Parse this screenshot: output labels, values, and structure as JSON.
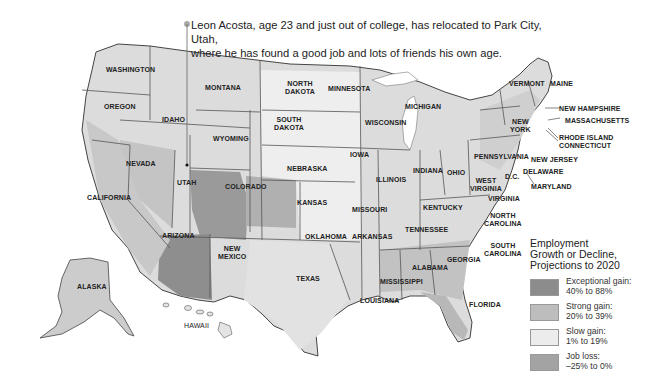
{
  "callout": {
    "line1": "Leon Acosta, age 23 and just out of college, has relocated to Park City, Utah,",
    "line2": "where he has found a good job and lots of friends his own age."
  },
  "legend": {
    "title_line1": "Employment",
    "title_line2": "Growth or Decline,",
    "title_line3": "Projections to 2020",
    "items": [
      {
        "label": "Exceptional gain:",
        "range": "40% to 88%",
        "color": "#8c8c8c"
      },
      {
        "label": "Strong gain:",
        "range": "20% to 39%",
        "color": "#bdbdbd"
      },
      {
        "label": "Slow gain:",
        "range": "1% to 19%",
        "color": "#ececec"
      },
      {
        "label": "Job loss:",
        "range": "–25% to 0%",
        "color": "#a3a3a3"
      }
    ]
  },
  "states": {
    "washington": "WASHINGTON",
    "oregon": "OREGON",
    "idaho": "IDAHO",
    "montana": "MONTANA",
    "wyoming": "WYOMING",
    "nevada": "NEVADA",
    "utah": "UTAH",
    "colorado": "COLORADO",
    "california": "CALIFORNIA",
    "arizona": "ARIZONA",
    "new_mexico_1": "NEW",
    "new_mexico_2": "MEXICO",
    "north_dakota_1": "NORTH",
    "north_dakota_2": "DAKOTA",
    "south_dakota_1": "SOUTH",
    "south_dakota_2": "DAKOTA",
    "nebraska": "NEBRASKA",
    "kansas": "KANSAS",
    "oklahoma": "OKLAHOMA",
    "texas": "TEXAS",
    "minnesota": "MINNESOTA",
    "iowa": "IOWA",
    "missouri": "MISSOURI",
    "arkansas": "ARKANSAS",
    "louisiana": "LOUISIANA",
    "wisconsin": "WISCONSIN",
    "illinois": "ILLINOIS",
    "michigan": "MICHIGAN",
    "indiana": "INDIANA",
    "ohio": "OHIO",
    "kentucky": "KENTUCKY",
    "tennessee": "TENNESSEE",
    "mississippi": "MISSISSIPPI",
    "alabama": "ALABAMA",
    "georgia": "GEORGIA",
    "florida": "FLORIDA",
    "south_carolina_1": "SOUTH",
    "south_carolina_2": "CAROLINA",
    "north_carolina_1": "NORTH",
    "north_carolina_2": "CAROLINA",
    "virginia": "VIRGINIA",
    "west_virginia_1": "WEST",
    "west_virginia_2": "VIRGINIA",
    "pennsylvania": "PENNSYLVANIA",
    "new_york_1": "NEW",
    "new_york_2": "YORK",
    "vermont": "VERMONT",
    "maine": "MAINE",
    "new_hampshire": "NEW HAMPSHIRE",
    "massachusetts": "MASSACHUSETTS",
    "rhode_island": "RHODE ISLAND",
    "connecticut": "CONNECTICUT",
    "new_jersey": "NEW JERSEY",
    "delaware": "DELAWARE",
    "maryland": "MARYLAND",
    "dc": "D.C.",
    "alaska": "ALASKA",
    "hawaii": "HAWAII"
  }
}
